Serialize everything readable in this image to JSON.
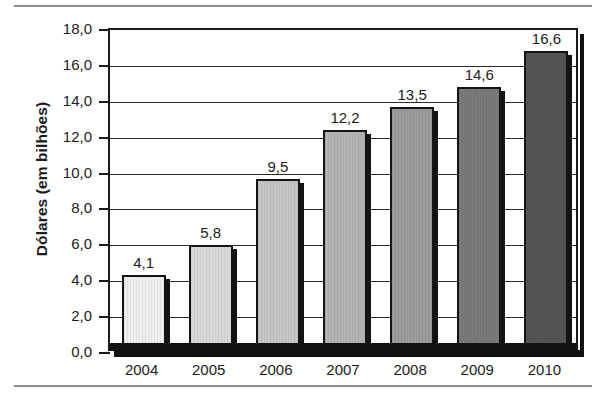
{
  "chart_data": {
    "type": "bar",
    "title": "",
    "subtitle": "",
    "xlabel": "",
    "ylabel": "Dólares (em bilhões)",
    "categories": [
      "2004",
      "2005",
      "2006",
      "2007",
      "2008",
      "2009",
      "2010"
    ],
    "values": [
      4.1,
      5.8,
      9.5,
      12.2,
      13.5,
      14.6,
      16.6
    ],
    "value_labels": [
      "4,1",
      "5,8",
      "9,5",
      "12,2",
      "13,5",
      "14,6",
      "16,6"
    ],
    "ylim": [
      0,
      18
    ],
    "ytick_values": [
      0,
      2,
      4,
      6,
      8,
      10,
      12,
      14,
      16,
      18
    ],
    "ytick_labels": [
      "0,0",
      "2,0",
      "4,0",
      "6,0",
      "8,0",
      "10,0",
      "12,0",
      "14,0",
      "16,0",
      "18,0"
    ],
    "grid": true,
    "legend": "none",
    "legend_position": "none",
    "decimal_separator": ",",
    "bar_colors": [
      "#efefef",
      "#d9d9d9",
      "#c6c6c6",
      "#b3b3b3",
      "#9b9b9b",
      "#7a7a7a",
      "#555555"
    ],
    "bar_outline_color": "#141414",
    "axis_color": "#1a1a1a",
    "gridline_color": "#2a2a2a",
    "text_color": "#1c1c1c",
    "background_color": "#ffffff"
  },
  "figure": {
    "y_axis_title": "Dólares (em bilhões)"
  }
}
